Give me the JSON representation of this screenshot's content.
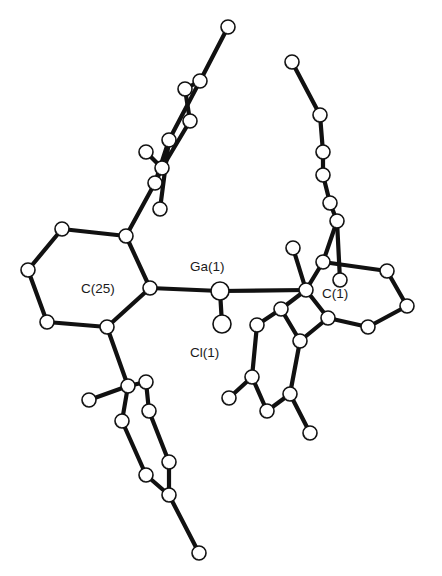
{
  "figure": {
    "type": "ORTEP molecular structure",
    "labels": {
      "ga": "Ga(1)",
      "cl": "Cl(1)",
      "c25": "C(25)",
      "c1": "C(1)"
    },
    "colors": {
      "background": "#ffffff",
      "ink": "#111111"
    },
    "atoms": [
      {
        "id": "Ga1",
        "x": 220,
        "y": 291,
        "r": 9,
        "style": "hatched"
      },
      {
        "id": "Cl1",
        "x": 222,
        "y": 324,
        "r": 9,
        "style": "dotted"
      },
      {
        "id": "C25",
        "x": 150,
        "y": 288,
        "r": 7
      },
      {
        "id": "L2",
        "x": 126,
        "y": 236,
        "r": 7
      },
      {
        "id": "L3",
        "x": 62,
        "y": 229,
        "r": 7
      },
      {
        "id": "L4",
        "x": 28,
        "y": 270,
        "r": 7
      },
      {
        "id": "L5",
        "x": 47,
        "y": 322,
        "r": 7
      },
      {
        "id": "L6",
        "x": 107,
        "y": 327,
        "r": 7
      },
      {
        "id": "UL1",
        "x": 155,
        "y": 183,
        "r": 7
      },
      {
        "id": "UL2",
        "x": 162,
        "y": 168,
        "r": 7
      },
      {
        "id": "UL3",
        "x": 146,
        "y": 152,
        "r": 7
      },
      {
        "id": "UL4",
        "x": 169,
        "y": 140,
        "r": 7
      },
      {
        "id": "UL5",
        "x": 190,
        "y": 121,
        "r": 7
      },
      {
        "id": "UL6",
        "x": 185,
        "y": 89,
        "r": 7
      },
      {
        "id": "UL7",
        "x": 200,
        "y": 81,
        "r": 7
      },
      {
        "id": "UL8",
        "x": 228,
        "y": 27,
        "r": 7
      },
      {
        "id": "UL9",
        "x": 160,
        "y": 209,
        "r": 7
      },
      {
        "id": "LL1",
        "x": 128,
        "y": 386,
        "r": 7
      },
      {
        "id": "LL2",
        "x": 146,
        "y": 382,
        "r": 7
      },
      {
        "id": "LL3",
        "x": 149,
        "y": 411,
        "r": 7
      },
      {
        "id": "LL4",
        "x": 89,
        "y": 400,
        "r": 7
      },
      {
        "id": "LL5",
        "x": 122,
        "y": 421,
        "r": 7
      },
      {
        "id": "LL6",
        "x": 169,
        "y": 462,
        "r": 7
      },
      {
        "id": "LL7",
        "x": 146,
        "y": 475,
        "r": 7
      },
      {
        "id": "LL8",
        "x": 169,
        "y": 495,
        "r": 7
      },
      {
        "id": "LL9",
        "x": 199,
        "y": 553,
        "r": 7
      },
      {
        "id": "C1",
        "x": 306,
        "y": 290,
        "r": 7
      },
      {
        "id": "R2",
        "x": 323,
        "y": 262,
        "r": 7
      },
      {
        "id": "R3",
        "x": 340,
        "y": 280,
        "r": 7
      },
      {
        "id": "R4",
        "x": 387,
        "y": 271,
        "r": 7
      },
      {
        "id": "R5",
        "x": 407,
        "y": 306,
        "r": 7
      },
      {
        "id": "R6",
        "x": 368,
        "y": 327,
        "r": 7
      },
      {
        "id": "R7",
        "x": 328,
        "y": 318,
        "r": 7
      },
      {
        "id": "Me1",
        "x": 293,
        "y": 248,
        "r": 7
      },
      {
        "id": "UR1",
        "x": 337,
        "y": 221,
        "r": 7
      },
      {
        "id": "UR2",
        "x": 323,
        "y": 175,
        "r": 7
      },
      {
        "id": "UR3",
        "x": 323,
        "y": 152,
        "r": 7
      },
      {
        "id": "UR4",
        "x": 320,
        "y": 115,
        "r": 7
      },
      {
        "id": "UR5",
        "x": 292,
        "y": 62,
        "r": 7
      },
      {
        "id": "UR6",
        "x": 330,
        "y": 203,
        "r": 7
      },
      {
        "id": "LR1",
        "x": 281,
        "y": 309,
        "r": 7
      },
      {
        "id": "LR2",
        "x": 257,
        "y": 325,
        "r": 7
      },
      {
        "id": "LR3",
        "x": 300,
        "y": 341,
        "r": 7
      },
      {
        "id": "LR4",
        "x": 252,
        "y": 377,
        "r": 7
      },
      {
        "id": "LR5",
        "x": 290,
        "y": 394,
        "r": 7
      },
      {
        "id": "LR6",
        "x": 229,
        "y": 398,
        "r": 7
      },
      {
        "id": "LR7",
        "x": 267,
        "y": 411,
        "r": 7
      },
      {
        "id": "LR8",
        "x": 310,
        "y": 433,
        "r": 7
      }
    ],
    "bonds": [
      [
        "Ga1",
        "Cl1"
      ],
      [
        "Ga1",
        "C25"
      ],
      [
        "Ga1",
        "C1"
      ],
      [
        "C25",
        "L2"
      ],
      [
        "L2",
        "L3"
      ],
      [
        "L3",
        "L4"
      ],
      [
        "L4",
        "L5"
      ],
      [
        "L5",
        "L6"
      ],
      [
        "L6",
        "C25"
      ],
      [
        "L2",
        "UL1"
      ],
      [
        "UL1",
        "UL4"
      ],
      [
        "UL4",
        "UL7"
      ],
      [
        "UL7",
        "UL8"
      ],
      [
        "UL1",
        "UL2"
      ],
      [
        "UL2",
        "UL3"
      ],
      [
        "UL2",
        "UL5"
      ],
      [
        "UL5",
        "UL6"
      ],
      [
        "UL6",
        "UL7"
      ],
      [
        "UL4",
        "UL9"
      ],
      [
        "L6",
        "LL1"
      ],
      [
        "LL1",
        "LL4"
      ],
      [
        "LL1",
        "LL2"
      ],
      [
        "LL1",
        "LL5"
      ],
      [
        "LL2",
        "LL3"
      ],
      [
        "LL3",
        "LL6"
      ],
      [
        "LL5",
        "LL7"
      ],
      [
        "LL7",
        "LL8"
      ],
      [
        "LL6",
        "LL8"
      ],
      [
        "LL8",
        "LL9"
      ],
      [
        "C1",
        "R2"
      ],
      [
        "R2",
        "R4"
      ],
      [
        "R4",
        "R5"
      ],
      [
        "R5",
        "R6"
      ],
      [
        "R6",
        "R7"
      ],
      [
        "R7",
        "C1"
      ],
      [
        "C1",
        "Me1"
      ],
      [
        "R2",
        "UR1"
      ],
      [
        "UR1",
        "UR6"
      ],
      [
        "UR6",
        "UR2"
      ],
      [
        "UR2",
        "UR3"
      ],
      [
        "UR3",
        "UR4"
      ],
      [
        "UR4",
        "UR5"
      ],
      [
        "R3",
        "UR1"
      ],
      [
        "C1",
        "LR1"
      ],
      [
        "LR1",
        "LR2"
      ],
      [
        "LR1",
        "LR3"
      ],
      [
        "LR2",
        "LR4"
      ],
      [
        "LR3",
        "LR5"
      ],
      [
        "LR4",
        "LR6"
      ],
      [
        "LR4",
        "LR7"
      ],
      [
        "LR5",
        "LR7"
      ],
      [
        "LR5",
        "LR8"
      ],
      [
        "LR3",
        "R7"
      ]
    ]
  }
}
